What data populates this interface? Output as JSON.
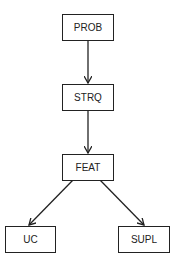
{
  "diagram": {
    "type": "tree",
    "nodes": [
      {
        "id": "prob",
        "label": "PROB"
      },
      {
        "id": "strq",
        "label": "STRQ"
      },
      {
        "id": "feat",
        "label": "FEAT"
      },
      {
        "id": "uc",
        "label": "UC"
      },
      {
        "id": "supl",
        "label": "SUPL"
      }
    ],
    "edges": [
      {
        "from": "PROB",
        "to": "STRQ"
      },
      {
        "from": "STRQ",
        "to": "FEAT"
      },
      {
        "from": "FEAT",
        "to": "UC"
      },
      {
        "from": "FEAT",
        "to": "SUPL"
      }
    ],
    "colors": {
      "stroke": "#222222",
      "background": "#ffffff"
    }
  }
}
